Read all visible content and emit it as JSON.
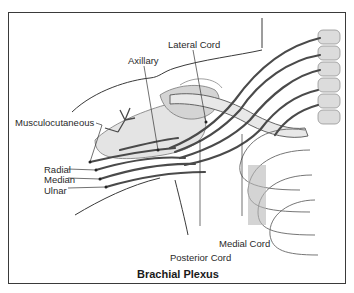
{
  "figure": {
    "title": "Brachial Plexus",
    "labels": {
      "lateral_cord": "Lateral Cord",
      "axillary": "Axillary",
      "musculocutaneous": "Musculocutaneous",
      "radial": "Radial",
      "median": "Median",
      "ulnar": "Ulnar",
      "posterior_cord": "Posterior Cord",
      "medial_cord": "Medial Cord"
    },
    "colors": {
      "nerve": "#4a4a4a",
      "bone": "#d8d8d8",
      "outline": "#3a3a3a",
      "muscle": "#a8a8a8",
      "frame": "#3a3a3a"
    }
  }
}
